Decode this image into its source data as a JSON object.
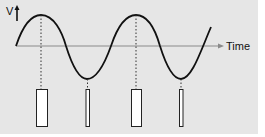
{
  "diagram": {
    "y_axis_label": "V",
    "x_axis_label": "Time",
    "colors": {
      "background": "#e6e6e6",
      "wave": "#111111",
      "axis": "#8a8a8a",
      "bar_fill": "#ffffff",
      "bar_stroke": "#222222",
      "guide": "#333333"
    },
    "wave": {
      "peaks": [
        [
          41,
          15
        ],
        [
          136,
          15
        ]
      ],
      "troughs": [
        [
          87,
          79
        ],
        [
          181,
          79
        ]
      ],
      "axis_y": 46
    },
    "bars": [
      {
        "label": "peak-1",
        "x": 36,
        "width": 11,
        "top": 89,
        "height": 37
      },
      {
        "label": "trough-1",
        "x": 86,
        "width": 4,
        "top": 89,
        "height": 37
      },
      {
        "label": "peak-2",
        "x": 131,
        "width": 10,
        "top": 89,
        "height": 37
      },
      {
        "label": "trough-2",
        "x": 179,
        "width": 4,
        "top": 89,
        "height": 37
      }
    ]
  }
}
